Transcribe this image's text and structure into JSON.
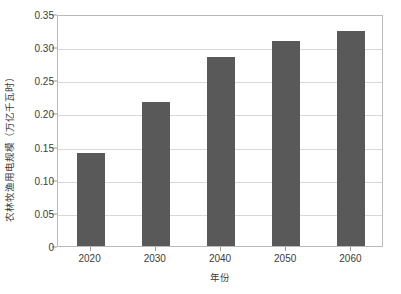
{
  "chart_data": {
    "type": "bar",
    "title": "",
    "categories": [
      "2020",
      "2030",
      "2040",
      "2050",
      "2060"
    ],
    "values": [
      0.141,
      0.218,
      0.285,
      0.309,
      0.324
    ],
    "series": [
      {
        "name": "农林牧渔用电规模",
        "values": [
          0.141,
          0.218,
          0.285,
          0.309,
          0.324
        ]
      }
    ],
    "xlabel": "年份",
    "ylabel": "农林牧渔用电规模（万亿千瓦时）",
    "ylim": [
      0,
      0.35
    ],
    "yticks": [
      0,
      0.05,
      0.1,
      0.15,
      0.2,
      0.25,
      0.3,
      0.35
    ],
    "ytick_labels": [
      "0",
      "0.05",
      "0.10",
      "0.15",
      "0.20",
      "0.25",
      "0.30",
      "0.35"
    ],
    "grid": "horizontal",
    "legend": "none",
    "bar_color": "#595959",
    "grid_color": "#d8d8d8",
    "frame_color": "#b9b9b9",
    "background": "#ffffff"
  }
}
